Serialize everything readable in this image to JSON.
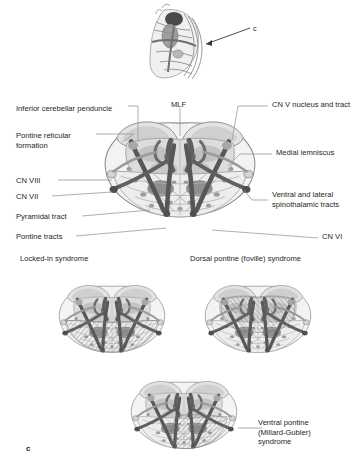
{
  "figure": {
    "panel_letter": "c",
    "inset": {
      "arrow_label": "c",
      "description": "brainstem-lateral-view-inset"
    }
  },
  "main_section": {
    "title": "pons-cross-section-labeled",
    "labels_left": [
      {
        "id": "inferior-cerebellar-peduncle",
        "text": "Inferior cerebellar penduncle",
        "x": 16,
        "y": 104
      },
      {
        "id": "pontine-reticular-formation",
        "text": "Pontine reticular\nformation",
        "x": 16,
        "y": 131
      },
      {
        "id": "cn-viii",
        "text": "CN VIII",
        "x": 16,
        "y": 176
      },
      {
        "id": "cn-vii",
        "text": "CN VII",
        "x": 16,
        "y": 192
      },
      {
        "id": "pyramidal-tract",
        "text": "Pyramidal tract",
        "x": 16,
        "y": 213
      },
      {
        "id": "pontine-tracts",
        "text": "Pontine tracts",
        "x": 16,
        "y": 233
      }
    ],
    "labels_top": [
      {
        "id": "mlf",
        "text": "MLF",
        "x": 172,
        "y": 104
      }
    ],
    "labels_right": [
      {
        "id": "cn-v-nucleus-and-tract",
        "text": "CN V nucleus and tract",
        "x": 272,
        "y": 104
      },
      {
        "id": "medial-lemniscus",
        "text": "Medial lemniscus",
        "x": 276,
        "y": 152
      },
      {
        "id": "ventral-and-lateral-spinothalamic-tracts",
        "text": "Ventral and lateral\nspinothalamic tracts",
        "x": 272,
        "y": 194
      },
      {
        "id": "cn-vi",
        "text": "CN VI",
        "x": 322,
        "y": 236
      }
    ]
  },
  "syndromes": [
    {
      "id": "locked-in-syndrome",
      "title": "Locked-in syndrome",
      "x": 20,
      "y": 254,
      "lesion": "ventral-basis-pontis-bilateral"
    },
    {
      "id": "dorsal-pontine-foville-syndrome",
      "title": "Dorsal pontine (foville) syndrome",
      "x": 190,
      "y": 254,
      "lesion": "dorsal-tegmentum"
    },
    {
      "id": "ventral-pontine-millard-gubler-syndrome",
      "title": "Ventral pontine\n(Millard-Gubler)\nsyndrome",
      "x": 268,
      "y": 418,
      "lesion": "ventral-lateral-unilateral"
    }
  ],
  "colors": {
    "outline": "#8a8a8a",
    "outline_dark": "#6e6e6e",
    "tract_dark": "#575757",
    "tract_mid": "#8d8d8d",
    "tegmentum": "#b9b9b9",
    "tegmentum_dark": "#9a9a9a",
    "parenchyma_light": "#ededed",
    "parenchyma_mid": "#dcdcdc",
    "peduncle": "#cfcfcf",
    "nucleus": "#9c9c9c",
    "hatch": "#7a7a7a",
    "text": "#231f20",
    "leader": "#9b9b9b",
    "background": "#ffffff"
  }
}
